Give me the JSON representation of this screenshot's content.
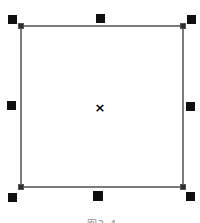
{
  "canvas": {
    "background": "#ffffff",
    "selection": {
      "center_marker": "×",
      "handle_color": "#0f0f0f",
      "outline_color": "#7b7b7b",
      "node_color": "#2e2e2e",
      "handle_positions": [
        "top-left",
        "top-center",
        "top-right",
        "middle-left",
        "middle-right",
        "bottom-left",
        "bottom-center",
        "bottom-right"
      ]
    },
    "caption": {
      "text": "图2-4",
      "color": "#8f8f8f"
    }
  }
}
